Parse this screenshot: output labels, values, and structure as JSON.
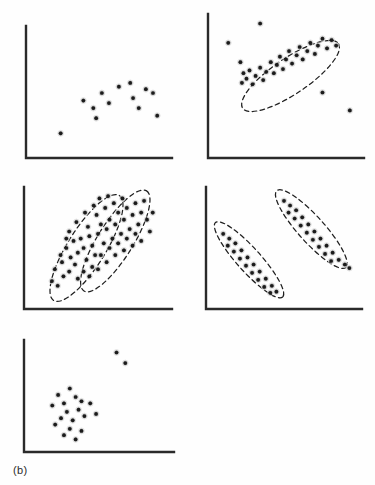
{
  "figure": {
    "label": "(b)",
    "caption_text": "(b)",
    "panel_count": 5,
    "background_color": "#fefefe",
    "axis_color": "#2a2a2a",
    "point_color": "#1b1b1b",
    "ellipse_color": "#1f1f1f",
    "ellipse_style": "dashed"
  },
  "chart_data": [
    {
      "type": "scatter",
      "name": "panel-top-left",
      "title": "",
      "xlabel": "",
      "ylabel": "",
      "xlim": [
        0,
        100
      ],
      "ylim": [
        0,
        100
      ],
      "grid": false,
      "legend": "none",
      "annotations": [],
      "ellipses": [],
      "points": [
        [
          23,
          18
        ],
        [
          39,
          44
        ],
        [
          46,
          38
        ],
        [
          48,
          30
        ],
        [
          52,
          50
        ],
        [
          57,
          42
        ],
        [
          64,
          55
        ],
        [
          72,
          58
        ],
        [
          74,
          46
        ],
        [
          78,
          38
        ],
        [
          83,
          53
        ],
        [
          88,
          50
        ],
        [
          91,
          32
        ]
      ]
    },
    {
      "type": "scatter",
      "name": "panel-top-right",
      "title": "",
      "xlabel": "",
      "ylabel": "",
      "xlim": [
        0,
        100
      ],
      "ylim": [
        0,
        100
      ],
      "grid": false,
      "legend": "none",
      "annotations": [
        "dashed ellipse enclosing elongated positively-sloped cluster"
      ],
      "ellipses": [
        {
          "cx": 53,
          "cy": 58,
          "rx": 38,
          "ry": 13,
          "angle": -34
        }
      ],
      "points": [
        [
          20,
          68
        ],
        [
          22,
          60
        ],
        [
          24,
          56
        ],
        [
          26,
          62
        ],
        [
          21,
          53
        ],
        [
          28,
          52
        ],
        [
          30,
          58
        ],
        [
          33,
          64
        ],
        [
          35,
          55
        ],
        [
          37,
          61
        ],
        [
          40,
          68
        ],
        [
          42,
          60
        ],
        [
          44,
          66
        ],
        [
          46,
          72
        ],
        [
          48,
          63
        ],
        [
          50,
          70
        ],
        [
          52,
          76
        ],
        [
          54,
          67
        ],
        [
          57,
          73
        ],
        [
          59,
          79
        ],
        [
          61,
          70
        ],
        [
          64,
          76
        ],
        [
          66,
          82
        ],
        [
          69,
          74
        ],
        [
          71,
          80
        ],
        [
          74,
          85
        ],
        [
          77,
          78
        ],
        [
          80,
          84
        ],
        [
          83,
          80
        ],
        [
          33,
          96
        ],
        [
          12,
          82
        ],
        [
          74,
          46
        ],
        [
          92,
          33
        ]
      ]
    },
    {
      "type": "scatter",
      "name": "panel-middle-left",
      "title": "",
      "xlabel": "",
      "ylabel": "",
      "xlim": [
        0,
        100
      ],
      "ylim": [
        0,
        100
      ],
      "grid": false,
      "legend": "none",
      "annotations": [
        "two overlapping dashed ellipses over one dense point cloud"
      ],
      "ellipses": [
        {
          "cx": 42,
          "cy": 50,
          "rx": 43,
          "ry": 16,
          "angle": -58
        },
        {
          "cx": 62,
          "cy": 56,
          "rx": 41,
          "ry": 15,
          "angle": -58
        }
      ],
      "points": [
        [
          18,
          22
        ],
        [
          22,
          18
        ],
        [
          26,
          26
        ],
        [
          20,
          32
        ],
        [
          25,
          38
        ],
        [
          30,
          30
        ],
        [
          31,
          42
        ],
        [
          28,
          50
        ],
        [
          34,
          36
        ],
        [
          36,
          46
        ],
        [
          33,
          56
        ],
        [
          38,
          58
        ],
        [
          40,
          50
        ],
        [
          42,
          40
        ],
        [
          44,
          60
        ],
        [
          46,
          52
        ],
        [
          43,
          68
        ],
        [
          48,
          44
        ],
        [
          50,
          62
        ],
        [
          52,
          70
        ],
        [
          49,
          78
        ],
        [
          54,
          54
        ],
        [
          56,
          66
        ],
        [
          58,
          74
        ],
        [
          55,
          84
        ],
        [
          60,
          58
        ],
        [
          62,
          70
        ],
        [
          64,
          80
        ],
        [
          61,
          88
        ],
        [
          66,
          62
        ],
        [
          68,
          74
        ],
        [
          70,
          84
        ],
        [
          67,
          92
        ],
        [
          72,
          66
        ],
        [
          74,
          78
        ],
        [
          76,
          88
        ],
        [
          78,
          70
        ],
        [
          80,
          80
        ],
        [
          82,
          90
        ],
        [
          84,
          74
        ],
        [
          36,
          24
        ],
        [
          40,
          30
        ],
        [
          46,
          34
        ],
        [
          52,
          44
        ],
        [
          58,
          50
        ],
        [
          64,
          54
        ],
        [
          70,
          58
        ],
        [
          76,
          62
        ],
        [
          30,
          64
        ],
        [
          35,
          72
        ],
        [
          41,
          80
        ],
        [
          47,
          86
        ],
        [
          24,
          44
        ],
        [
          28,
          58
        ],
        [
          51,
          92
        ],
        [
          57,
          94
        ],
        [
          44,
          26
        ],
        [
          50,
          32
        ],
        [
          56,
          38
        ],
        [
          62,
          44
        ],
        [
          68,
          48
        ],
        [
          74,
          52
        ],
        [
          80,
          56
        ],
        [
          86,
          64
        ],
        [
          88,
          80
        ]
      ]
    },
    {
      "type": "scatter",
      "name": "panel-middle-right",
      "title": "",
      "xlabel": "",
      "ylabel": "",
      "xlim": [
        0,
        100
      ],
      "ylim": [
        0,
        100
      ],
      "grid": false,
      "legend": "none",
      "annotations": [
        "two separated parallel dashed ellipses, each enclosing a negatively-sloped cluster"
      ],
      "ellipses": [
        {
          "cx": 27,
          "cy": 40,
          "rx": 33,
          "ry": 10,
          "angle": 48
        },
        {
          "cx": 68,
          "cy": 66,
          "rx": 34,
          "ry": 11,
          "angle": 48
        }
      ],
      "points": [
        [
          10,
          62
        ],
        [
          14,
          58
        ],
        [
          13,
          52
        ],
        [
          18,
          54
        ],
        [
          17,
          47
        ],
        [
          22,
          48
        ],
        [
          21,
          41
        ],
        [
          26,
          42
        ],
        [
          25,
          35
        ],
        [
          30,
          36
        ],
        [
          29,
          29
        ],
        [
          34,
          30
        ],
        [
          33,
          23
        ],
        [
          38,
          24
        ],
        [
          37,
          17
        ],
        [
          42,
          18
        ],
        [
          41,
          12
        ],
        [
          45,
          13
        ],
        [
          50,
          90
        ],
        [
          54,
          86
        ],
        [
          53,
          80
        ],
        [
          58,
          82
        ],
        [
          57,
          75
        ],
        [
          62,
          76
        ],
        [
          61,
          69
        ],
        [
          66,
          70
        ],
        [
          65,
          63
        ],
        [
          70,
          64
        ],
        [
          69,
          57
        ],
        [
          74,
          58
        ],
        [
          73,
          51
        ],
        [
          78,
          52
        ],
        [
          77,
          45
        ],
        [
          82,
          46
        ],
        [
          81,
          39
        ],
        [
          86,
          40
        ],
        [
          90,
          36
        ],
        [
          93,
          33
        ]
      ]
    },
    {
      "type": "scatter",
      "name": "panel-bottom",
      "title": "",
      "xlabel": "",
      "ylabel": "",
      "xlim": [
        0,
        100
      ],
      "ylim": [
        0,
        100
      ],
      "grid": false,
      "legend": "none",
      "annotations": [
        "compact lower-left cluster with two distant upper-right outliers"
      ],
      "ellipses": [],
      "points": [
        [
          22,
          52
        ],
        [
          30,
          58
        ],
        [
          26,
          44
        ],
        [
          34,
          50
        ],
        [
          18,
          42
        ],
        [
          38,
          46
        ],
        [
          28,
          36
        ],
        [
          36,
          38
        ],
        [
          24,
          30
        ],
        [
          32,
          28
        ],
        [
          20,
          24
        ],
        [
          40,
          32
        ],
        [
          44,
          44
        ],
        [
          30,
          20
        ],
        [
          38,
          18
        ],
        [
          26,
          14
        ],
        [
          34,
          10
        ],
        [
          48,
          34
        ],
        [
          62,
          92
        ],
        [
          68,
          82
        ]
      ]
    }
  ]
}
